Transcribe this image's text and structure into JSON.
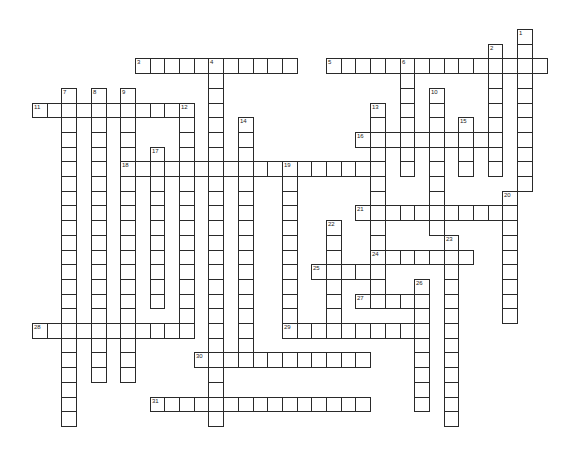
{
  "puzzle": {
    "type": "crossword",
    "grid": {
      "origin_x": 32,
      "origin_y": 29,
      "cell_size": 14.7
    },
    "colors": {
      "line": "#2a2a2a",
      "cell": "#ffffff",
      "background": "#ffffff"
    },
    "across": [
      {
        "number": "3",
        "row": 2,
        "col": 7,
        "length": 11
      },
      {
        "number": "5",
        "row": 2,
        "col": 20,
        "length": 15
      },
      {
        "number": "11",
        "row": 5,
        "col": 0,
        "length": 10
      },
      {
        "number": "16",
        "row": 7,
        "col": 22,
        "length": 10
      },
      {
        "number": "18",
        "row": 9,
        "col": 6,
        "length": 18
      },
      {
        "number": "21",
        "row": 12,
        "col": 22,
        "length": 11
      },
      {
        "number": "24",
        "row": 15,
        "col": 23,
        "length": 7
      },
      {
        "number": "25",
        "row": 16,
        "col": 19,
        "length": 5
      },
      {
        "number": "27",
        "row": 18,
        "col": 22,
        "length": 5
      },
      {
        "number": "28",
        "row": 20,
        "col": 0,
        "length": 11
      },
      {
        "number": "29",
        "row": 20,
        "col": 17,
        "length": 10
      },
      {
        "number": "30",
        "row": 22,
        "col": 11,
        "length": 12
      },
      {
        "number": "31",
        "row": 25,
        "col": 8,
        "length": 15
      }
    ],
    "down": [
      {
        "number": "1",
        "row": 0,
        "col": 33,
        "length": 11
      },
      {
        "number": "2",
        "row": 1,
        "col": 31,
        "length": 9
      },
      {
        "number": "4",
        "row": 2,
        "col": 12,
        "length": 25
      },
      {
        "number": "6",
        "row": 2,
        "col": 25,
        "length": 8
      },
      {
        "number": "7",
        "row": 4,
        "col": 2,
        "length": 23
      },
      {
        "number": "8",
        "row": 4,
        "col": 4,
        "length": 20
      },
      {
        "number": "9",
        "row": 4,
        "col": 6,
        "length": 20
      },
      {
        "number": "10",
        "row": 4,
        "col": 27,
        "length": 10
      },
      {
        "number": "12",
        "row": 5,
        "col": 10,
        "length": 16
      },
      {
        "number": "13",
        "row": 5,
        "col": 23,
        "length": 14
      },
      {
        "number": "14",
        "row": 6,
        "col": 14,
        "length": 17
      },
      {
        "number": "15",
        "row": 6,
        "col": 29,
        "length": 4
      },
      {
        "number": "17",
        "row": 8,
        "col": 8,
        "length": 11
      },
      {
        "number": "19",
        "row": 9,
        "col": 17,
        "length": 11
      },
      {
        "number": "20",
        "row": 11,
        "col": 32,
        "length": 9
      },
      {
        "number": "22",
        "row": 13,
        "col": 20,
        "length": 7
      },
      {
        "number": "23",
        "row": 14,
        "col": 28,
        "length": 13
      },
      {
        "number": "26",
        "row": 17,
        "col": 26,
        "length": 9
      }
    ]
  }
}
